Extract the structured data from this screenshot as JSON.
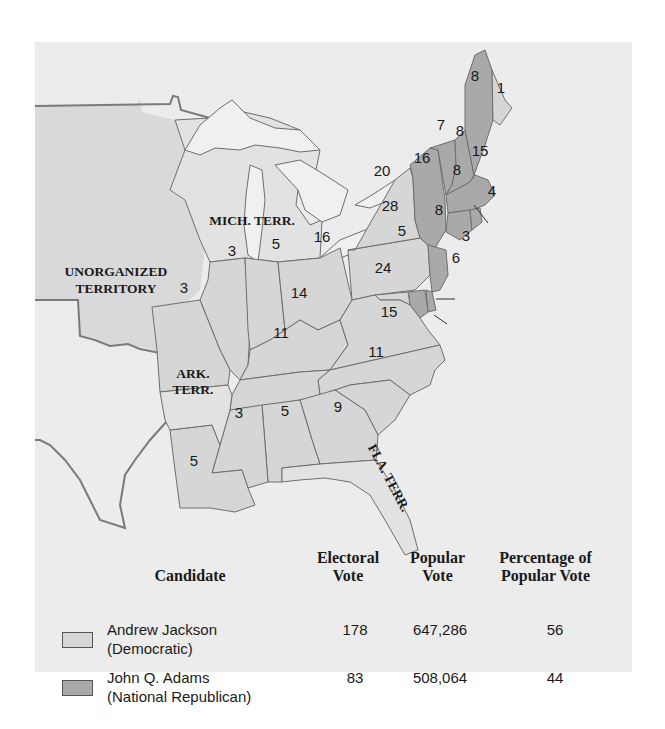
{
  "map": {
    "title": "Election of 1828",
    "territory_labels": {
      "unorganized_line1": "UNORGANIZED",
      "unorganized_line2": "TERRITORY",
      "mich_terr": "MICH. TERR.",
      "ark_line1": "ARK.",
      "ark_line2": "TERR.",
      "fla_terr": "FLA. TERR."
    },
    "colors": {
      "jackson": "#d6d6d6",
      "adams": "#a9a9a9",
      "territory": "#e2e2e2",
      "background": "#ececec"
    },
    "states": [
      {
        "name": "Maine (Adams)",
        "votes": "8",
        "winner": "Adams"
      },
      {
        "name": "Maine (Jackson)",
        "votes": "1",
        "winner": "Jackson"
      },
      {
        "name": "New Hampshire",
        "votes": "8",
        "winner": "Adams"
      },
      {
        "name": "Vermont",
        "votes": "7",
        "winner": "Adams"
      },
      {
        "name": "Massachusetts",
        "votes": "15",
        "winner": "Adams"
      },
      {
        "name": "Rhode Island",
        "votes": "4",
        "winner": "Adams"
      },
      {
        "name": "Connecticut",
        "votes": "8",
        "winner": "Adams"
      },
      {
        "name": "New York (Adams)",
        "votes": "16",
        "winner": "Adams"
      },
      {
        "name": "New York (Jackson)",
        "votes": "20",
        "winner": "Jackson"
      },
      {
        "name": "New Jersey",
        "votes": "8",
        "winner": "Adams"
      },
      {
        "name": "Pennsylvania",
        "votes": "28",
        "winner": "Jackson"
      },
      {
        "name": "Delaware",
        "votes": "3",
        "winner": "Adams"
      },
      {
        "name": "Maryland (Adams)",
        "votes": "6",
        "winner": "Adams"
      },
      {
        "name": "Maryland (Jackson)",
        "votes": "5",
        "winner": "Jackson"
      },
      {
        "name": "Virginia",
        "votes": "24",
        "winner": "Jackson"
      },
      {
        "name": "North Carolina",
        "votes": "15",
        "winner": "Jackson"
      },
      {
        "name": "South Carolina",
        "votes": "11",
        "winner": "Jackson"
      },
      {
        "name": "Georgia",
        "votes": "9",
        "winner": "Jackson"
      },
      {
        "name": "Alabama",
        "votes": "5",
        "winner": "Jackson"
      },
      {
        "name": "Mississippi",
        "votes": "3",
        "winner": "Jackson"
      },
      {
        "name": "Louisiana",
        "votes": "5",
        "winner": "Jackson"
      },
      {
        "name": "Tennessee",
        "votes": "11",
        "winner": "Jackson"
      },
      {
        "name": "Kentucky",
        "votes": "14",
        "winner": "Jackson"
      },
      {
        "name": "Ohio",
        "votes": "16",
        "winner": "Jackson"
      },
      {
        "name": "Indiana",
        "votes": "5",
        "winner": "Jackson"
      },
      {
        "name": "Illinois",
        "votes": "3",
        "winner": "Jackson"
      },
      {
        "name": "Missouri",
        "votes": "3",
        "winner": "Jackson"
      }
    ]
  },
  "legend": {
    "headers": {
      "candidate": "Candidate",
      "electoral_line1": "Electoral",
      "electoral_line2": "Vote",
      "popular_line1": "Popular",
      "popular_line2": "Vote",
      "percentage_line1": "Percentage of",
      "percentage_line2": "Popular Vote"
    },
    "rows": [
      {
        "name": "Andrew Jackson",
        "party": "(Democratic)",
        "electoral": "178",
        "popular": "647,286",
        "percentage": "56",
        "color": "#d6d6d6"
      },
      {
        "name": "John Q. Adams",
        "party": "(National Republican)",
        "electoral": "83",
        "popular": "508,064",
        "percentage": "44",
        "color": "#a9a9a9"
      }
    ]
  }
}
